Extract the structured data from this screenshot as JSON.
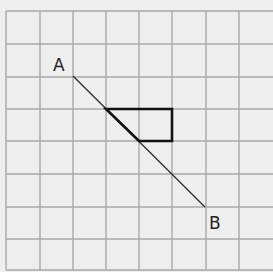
{
  "diagram": {
    "grid": {
      "x_lines": [
        6,
        40,
        73,
        106,
        139,
        172,
        206,
        239
      ],
      "y_lines": [
        11,
        44,
        77,
        109,
        141,
        174,
        207,
        239,
        270
      ],
      "color": "#a8a8a8",
      "background": "#eeeeee"
    },
    "segment": {
      "start_label": "A",
      "end_label": "B",
      "start": [
        73,
        76
      ],
      "end": [
        205,
        207
      ],
      "color": "#333333"
    },
    "triangle": {
      "points": [
        [
          106,
          109
        ],
        [
          172,
          109
        ],
        [
          172,
          141
        ],
        [
          139,
          141
        ]
      ],
      "color": "#111111"
    },
    "labels": {
      "a": "A",
      "b": "B"
    }
  }
}
